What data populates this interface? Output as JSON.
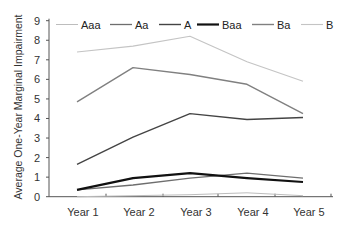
{
  "chart_data": {
    "type": "line",
    "title": "",
    "xlabel": "",
    "ylabel": "Average One-Year Marginal Impairment",
    "categories": [
      "Year 1",
      "Year 2",
      "Year 3",
      "Year 4",
      "Year 5"
    ],
    "ylim": [
      0,
      9
    ],
    "yticks": [
      0,
      1,
      2,
      3,
      4,
      5,
      6,
      7,
      8,
      9
    ],
    "grid": false,
    "legend_position": "top",
    "series": [
      {
        "name": "Aaa",
        "color": "#bdbdbd",
        "width": 1,
        "values": [
          0.0,
          0.05,
          0.1,
          0.2,
          0.05
        ]
      },
      {
        "name": "Aa",
        "color": "#6e6e6e",
        "width": 1.3,
        "values": [
          0.35,
          0.6,
          0.95,
          1.2,
          0.95
        ]
      },
      {
        "name": "A",
        "color": "#444444",
        "width": 1.4,
        "values": [
          1.65,
          3.05,
          4.25,
          3.95,
          4.05
        ]
      },
      {
        "name": "Baa",
        "color": "#111111",
        "width": 2.2,
        "values": [
          0.35,
          0.95,
          1.2,
          0.95,
          0.75
        ]
      },
      {
        "name": "Ba",
        "color": "#808080",
        "width": 1.4,
        "values": [
          4.85,
          6.6,
          6.25,
          5.75,
          4.25
        ]
      },
      {
        "name": "B",
        "color": "#c4c4c4",
        "width": 1.1,
        "values": [
          7.4,
          7.7,
          8.2,
          6.9,
          5.9
        ]
      }
    ]
  }
}
